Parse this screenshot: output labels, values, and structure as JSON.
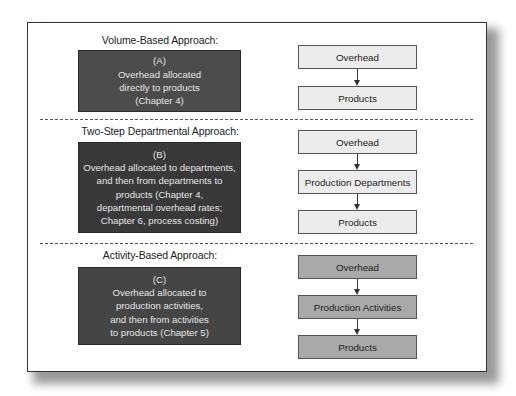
{
  "diagram": {
    "sections": [
      {
        "title": "Volume-Based Approach:",
        "description": {
          "label": "(A)",
          "lines": [
            "Overhead allocated",
            "directly to products",
            "(Chapter 4)"
          ]
        },
        "flow": [
          "Overhead",
          "Products"
        ],
        "flow_style": "light"
      },
      {
        "title": "Two-Step Departmental Approach:",
        "description": {
          "label": "(B)",
          "lines": [
            "Overhead allocated to departments,",
            "and then from departments to",
            "products (Chapter 4,",
            "departmental  overhead rates;",
            "Chapter 6, process costing)"
          ]
        },
        "flow": [
          "Overhead",
          "Production Departments",
          "Products"
        ],
        "flow_style": "light"
      },
      {
        "title": "Activity-Based Approach:",
        "description": {
          "label": "(C)",
          "lines": [
            "Overhead allocated to",
            "production activities,",
            "and then from activities",
            "to products (Chapter 5)"
          ]
        },
        "flow": [
          "Overhead",
          "Production Activities",
          "Products"
        ],
        "flow_style": "dark"
      }
    ],
    "colors": {
      "box_a_fill": "#4c4c4c",
      "box_b_fill": "#393939",
      "box_c_fill": "#454545",
      "flow_light_fill": "#ececec",
      "flow_dark_fill": "#a9a9a9",
      "description_text": "#e6e6e6"
    }
  }
}
